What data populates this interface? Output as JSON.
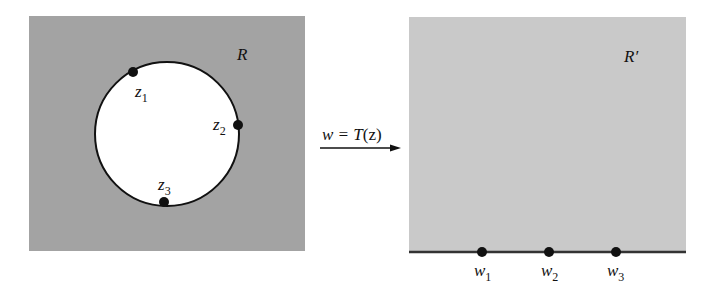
{
  "left_panel": {
    "region_label": "R",
    "fill": "#a3a3a3",
    "points": [
      {
        "name": "z",
        "sub": "1"
      },
      {
        "name": "z",
        "sub": "2"
      },
      {
        "name": "z",
        "sub": "3"
      }
    ]
  },
  "mapping": {
    "label_prefix": "w = T",
    "label_arg": "(z)"
  },
  "right_panel": {
    "region_label": "R′",
    "fill": "#c9c9c9",
    "points": [
      {
        "name": "w",
        "sub": "1"
      },
      {
        "name": "w",
        "sub": "2"
      },
      {
        "name": "w",
        "sub": "3"
      }
    ]
  }
}
